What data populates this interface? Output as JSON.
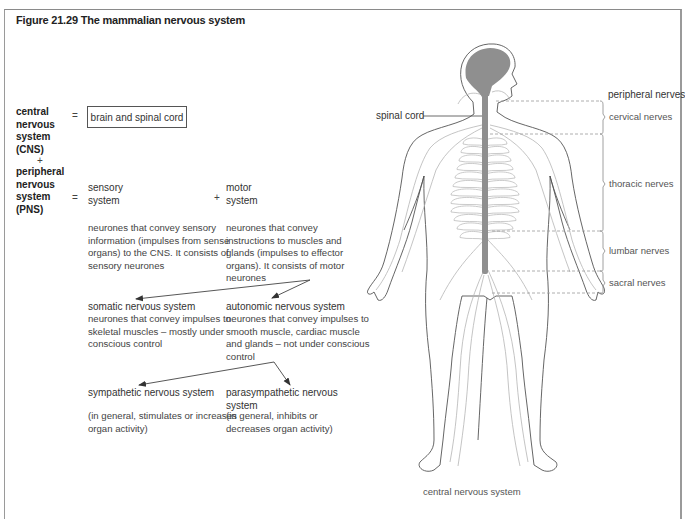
{
  "figure": {
    "title": "Figure 21.29  The mammalian nervous system"
  },
  "equation": {
    "cns_label": [
      "central",
      "nervous",
      "system",
      "(CNS)"
    ],
    "plus_sign": "+",
    "pns_label": [
      "peripheral",
      "nervous",
      "system",
      "(PNS)"
    ],
    "equals_sign": "=",
    "cns_box": "brain and spinal cord",
    "sensory": {
      "title": [
        "sensory",
        "system"
      ],
      "desc": [
        "neurones that convey sensory",
        "information (impulses from sense",
        "organs) to the CNS. It consists of",
        "sensory neurones"
      ]
    },
    "motor": {
      "title": [
        "motor",
        "system"
      ],
      "desc": [
        "neurones that convey",
        "instructions to muscles and",
        "glands (impulses to effector",
        "organs). It consists of motor",
        "neurones"
      ]
    },
    "somatic": {
      "title": "somatic nervous system",
      "desc": [
        "neurones that convey impulses to",
        "skeletal muscles – mostly under",
        "conscious control"
      ]
    },
    "autonomic": {
      "title": "autonomic nervous system",
      "desc": [
        "neurones that convey impulses to",
        "smooth muscle, cardiac muscle",
        "and glands – not under conscious",
        "control"
      ]
    },
    "sympathetic": {
      "title": "sympathetic nervous system",
      "desc": [
        "(in general, stimulates or increases",
        "organ activity)"
      ]
    },
    "parasympathetic": {
      "title": [
        "parasympathetic nervous",
        "system"
      ],
      "desc": [
        "(in general, inhibits or",
        "decreases organ activity)"
      ]
    }
  },
  "illustration": {
    "spinal_cord_label": "spinal cord",
    "cns_caption": "central nervous system",
    "peripheral_header": "peripheral nerves",
    "nerve_groups": [
      "cervical nerves",
      "thoracic nerves",
      "lumbar nerves",
      "sacral nerves"
    ],
    "colors": {
      "cns_fill": "#8f8f8f",
      "outline": "#555555",
      "nerve": "#b5b5b5"
    }
  }
}
